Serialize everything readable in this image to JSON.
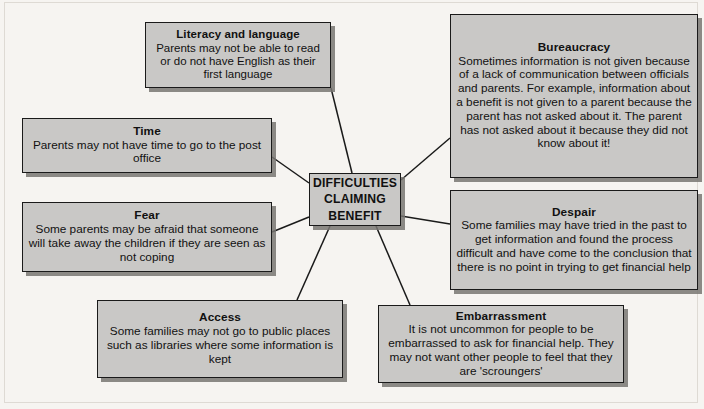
{
  "diagram": {
    "type": "mind-map",
    "center": {
      "lines": [
        "DIFFICULTIES",
        "CLAIMING",
        "BENEFIT"
      ]
    },
    "nodes": [
      {
        "id": "literacy",
        "title": "Literacy and language",
        "body": "Parents may not be able to read or do not have English as their first language"
      },
      {
        "id": "bureaucracy",
        "title": "Bureaucracy",
        "body": "Sometimes information is not given because of a lack of communication between officials and parents. For example, information about a benefit is not given to a parent because the parent has not asked about it. The parent has not asked about it because they did not know about it!"
      },
      {
        "id": "time",
        "title": "Time",
        "body": "Parents may not have time to go to the post office"
      },
      {
        "id": "fear",
        "title": "Fear",
        "body": "Some parents may be afraid that someone will take away the children if they are seen as not coping"
      },
      {
        "id": "despair",
        "title": "Despair",
        "body": "Some families may have tried in the past to get information and found the process difficult and have come to the conclusion that there is no point in trying to get financial help"
      },
      {
        "id": "access",
        "title": "Access",
        "body": "Some families may not go to public places such as libraries where some information is kept"
      },
      {
        "id": "embarrassment",
        "title": "Embarrassment",
        "body": "It is not uncommon for people to be embarrassed to ask for financial help. They may not want other people to feel that they are 'scroungers'"
      }
    ],
    "colors": {
      "background": "#f6f4f1",
      "node_fill": "#c9c8c6",
      "node_border": "#1a1a1a",
      "connector": "#1a1a1a",
      "text": "#111111"
    }
  }
}
